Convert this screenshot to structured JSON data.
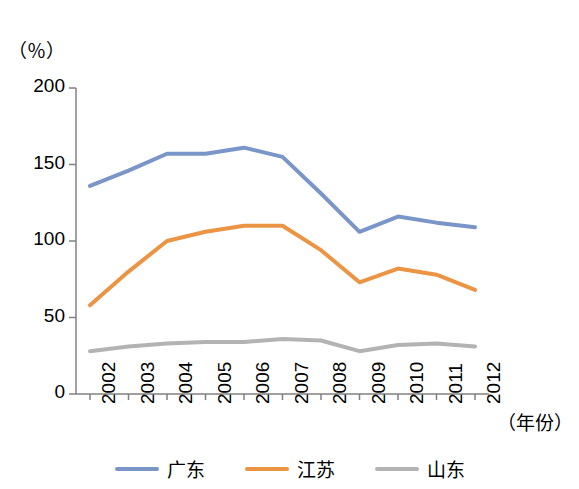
{
  "chart_data": {
    "type": "line",
    "title": "",
    "subtitle": "",
    "ylabel": "（％）",
    "xlabel": "（年份）",
    "categories": [
      "2002",
      "2003",
      "2004",
      "2005",
      "2006",
      "2007",
      "2008",
      "2009",
      "2010",
      "2011",
      "2012"
    ],
    "yticks": [
      "0",
      "50",
      "100",
      "150",
      "200"
    ],
    "ylim": [
      0,
      200
    ],
    "grid": false,
    "legend_position": "bottom",
    "series": [
      {
        "name": "广东",
        "color": "#7a96c9",
        "values": [
          136,
          146,
          157,
          157,
          161,
          155,
          131,
          106,
          116,
          112,
          109
        ]
      },
      {
        "name": "江苏",
        "color": "#eb9444",
        "values": [
          58,
          80,
          100,
          106,
          110,
          110,
          94,
          73,
          82,
          78,
          68
        ]
      },
      {
        "name": "山东",
        "color": "#b3b3b3",
        "values": [
          28,
          31,
          33,
          34,
          34,
          36,
          35,
          28,
          32,
          33,
          31
        ]
      }
    ]
  },
  "axis": {
    "unit_label": "（％）",
    "x_axis_title": "（年份）"
  },
  "legend": {
    "items": [
      {
        "label": "广东",
        "color": "#7a96c9"
      },
      {
        "label": "江苏",
        "color": "#eb9444"
      },
      {
        "label": "山东",
        "color": "#b3b3b3"
      }
    ]
  }
}
